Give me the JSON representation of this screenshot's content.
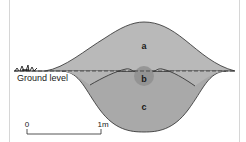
{
  "diagram": {
    "labels": {
      "a": "a",
      "b": "b",
      "c": "c",
      "ground": "Ground level"
    },
    "scale_bar": {
      "start_label": "0",
      "end_label": "1m"
    },
    "colors": {
      "mound_fill": "#b9b9b9",
      "bowl_fill": "#a9a9a9",
      "circle_fill": "#8f8f8f",
      "outline": "#2a2a2a",
      "background": "#ffffff",
      "border": "#d0d0d0"
    }
  }
}
